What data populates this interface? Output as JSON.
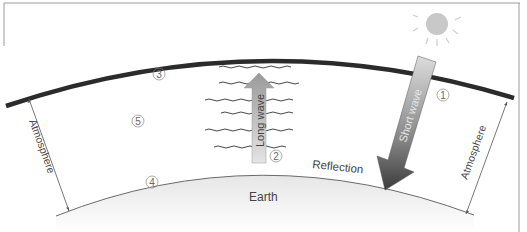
{
  "diagram": {
    "labels": {
      "short_wave": "Short wave",
      "long_wave": "Long wave",
      "reflection": "Reflection",
      "earth": "Earth",
      "atmosphere_left": "Atmosphere",
      "atmosphere_right": "Atmosphere"
    },
    "markers": {
      "m1": "1",
      "m2": "2",
      "m3": "3",
      "m4": "4",
      "m5": "5"
    },
    "colors": {
      "atmosphere_line": "#2b2b2b",
      "sun": "#c8c8c8",
      "short_wave_arrow_top": "#d4d4d4",
      "short_wave_arrow_bottom": "#4a4a4a",
      "long_wave_arrow": "#a8a8a8",
      "earth_fill": "#ebebeb"
    }
  }
}
